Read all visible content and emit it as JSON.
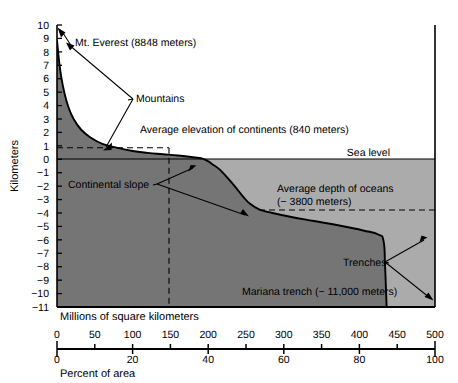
{
  "chart_data": {
    "type": "area",
    "title": "",
    "subtitle": "",
    "ylabel": "Kilometers",
    "ylim": [
      -11,
      10
    ],
    "y_ticks": [
      10,
      9,
      8,
      7,
      6,
      5,
      4,
      3,
      2,
      1,
      0,
      -1,
      -2,
      -3,
      -4,
      -5,
      -6,
      -7,
      -8,
      -9,
      -10,
      -11
    ],
    "y_tick_labels": [
      "10",
      "9",
      "8",
      "7",
      "6",
      "5",
      "4",
      "3",
      "2",
      "1",
      "0",
      "-1",
      "-2",
      "-3",
      "-4",
      "-5",
      "-6",
      "-7",
      "-8",
      "-9",
      "-10",
      "-11"
    ],
    "xlabel_primary": "Millions of square kilometers",
    "xlim_primary": [
      0,
      500
    ],
    "x_ticks_primary": [
      0,
      50,
      100,
      150,
      200,
      250,
      300,
      350,
      400,
      450,
      500
    ],
    "x_tick_labels_primary": [
      "0",
      "50",
      "100",
      "150",
      "200",
      "250",
      "300",
      "350",
      "400",
      "450",
      "500"
    ],
    "xlabel_secondary": "Percent of area",
    "xlim_secondary": [
      0,
      100
    ],
    "x_ticks_secondary": [
      0,
      20,
      40,
      60,
      80,
      100
    ],
    "x_tick_labels_secondary": [
      "0",
      "20",
      "40",
      "60",
      "80",
      "100"
    ],
    "grid": false,
    "legend": "none",
    "series": [
      {
        "name": "Hypsometric curve",
        "x_units": "millions of square kilometers",
        "y_units": "kilometers",
        "points": [
          [
            0,
            8.85
          ],
          [
            3,
            7.2
          ],
          [
            6,
            6.0
          ],
          [
            10,
            4.9
          ],
          [
            15,
            3.9
          ],
          [
            22,
            3.0
          ],
          [
            32,
            2.2
          ],
          [
            45,
            1.6
          ],
          [
            60,
            1.15
          ],
          [
            80,
            0.85
          ],
          [
            100,
            0.62
          ],
          [
            120,
            0.48
          ],
          [
            140,
            0.38
          ],
          [
            160,
            0.28
          ],
          [
            180,
            0.15
          ],
          [
            195,
            0.0
          ],
          [
            205,
            -0.35
          ],
          [
            215,
            -0.75
          ],
          [
            225,
            -1.35
          ],
          [
            235,
            -2.0
          ],
          [
            245,
            -2.7
          ],
          [
            255,
            -3.3
          ],
          [
            268,
            -3.75
          ],
          [
            285,
            -4.0
          ],
          [
            310,
            -4.3
          ],
          [
            340,
            -4.6
          ],
          [
            375,
            -4.95
          ],
          [
            405,
            -5.3
          ],
          [
            425,
            -5.6
          ],
          [
            432,
            -6.1
          ],
          [
            434,
            -8.0
          ],
          [
            436,
            -11.0
          ]
        ]
      }
    ],
    "reference_lines": [
      {
        "name": "sea-level",
        "orientation": "horizontal",
        "value": 0,
        "style": "solid",
        "label": "Sea level"
      },
      {
        "name": "average-elevation-of-continents",
        "orientation": "horizontal",
        "value": 0.84,
        "style": "dashed",
        "x_from": 0,
        "x_to": 148
      },
      {
        "name": "continental-area-divider",
        "orientation": "vertical",
        "value": 148,
        "style": "dashed",
        "y_from": -11,
        "y_to": 0.84
      },
      {
        "name": "average-depth-of-oceans",
        "orientation": "horizontal",
        "value": -3.8,
        "style": "dashed",
        "x_from": 268,
        "x_to": 500
      }
    ],
    "annotations": [
      {
        "name": "mt-everest",
        "text": "Mt. Everest  (8848 meters)",
        "target_x": 0,
        "target_y": 8.848
      },
      {
        "name": "mountains",
        "text": "Mountains",
        "target_x": 62,
        "target_y": 1.0
      },
      {
        "name": "average-elevation-of-continents",
        "text": "Average elevation of continents (840 meters)",
        "value_m": 840
      },
      {
        "name": "sea-level",
        "text": "Sea level",
        "value_m": 0
      },
      {
        "name": "continental-slope",
        "text": "Continental slope",
        "target_x": 212,
        "target_y": -0.6
      },
      {
        "name": "average-depth-of-oceans-line1",
        "text": "Average depth of oceans",
        "value_m": -3800
      },
      {
        "name": "average-depth-of-oceans-line2",
        "text": "(− 3800 meters)"
      },
      {
        "name": "trenches",
        "text": "Trenches",
        "target_x": 428,
        "target_y": -5.7
      },
      {
        "name": "mariana-trench",
        "text": "Mariana trench (− 11,000 meters)",
        "value_m": -11000
      }
    ],
    "colors": {
      "crust_fill": "#757575",
      "ocean_fill": "#ababab",
      "line": "#000000",
      "background": "#ffffff",
      "text": "#000000"
    }
  },
  "axes": {
    "y_title": "Kilometers",
    "x_title_primary": "Millions of square kilometers",
    "x_title_secondary": "Percent of area"
  }
}
